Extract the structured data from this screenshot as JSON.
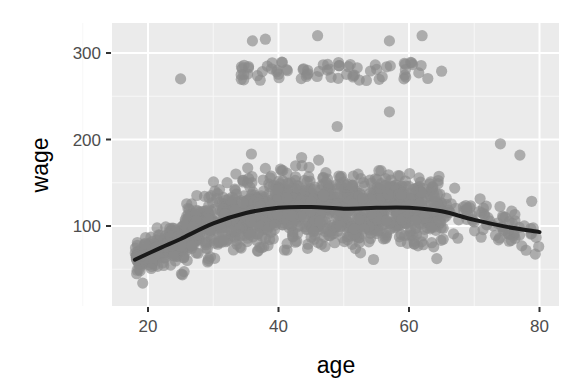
{
  "chart_data": {
    "type": "scatter",
    "title": "",
    "xlabel": "age",
    "ylabel": "wage",
    "xlim": [
      15,
      82
    ],
    "ylim": [
      8,
      335
    ],
    "x_ticks": [
      20,
      40,
      60,
      80
    ],
    "y_ticks": [
      100,
      200,
      300
    ],
    "grid": true,
    "legend": "none",
    "panel_background": "#ebebeb",
    "grid_color": "#ffffff",
    "point_color": "#8a8a8a",
    "point_alpha": 0.65,
    "line_color": "#1a1a1a",
    "series": [
      {
        "name": "points",
        "kind": "scatter",
        "description": "Approx. 3000 observations; dense band wage 40-200 across ages 18-80, peak density ages 30-60; separate high-earner band at wage ~270-285 for ages 35-62; sparse tails above 60.",
        "main_band": {
          "age_range": [
            18,
            80
          ],
          "wage_range": [
            25,
            205
          ]
        },
        "high_band": {
          "age_range": [
            34,
            63
          ],
          "wage_range": [
            268,
            290
          ]
        },
        "outliers": [
          {
            "age": 36,
            "wage": 314
          },
          {
            "age": 38,
            "wage": 316
          },
          {
            "age": 46,
            "wage": 320
          },
          {
            "age": 57,
            "wage": 314
          },
          {
            "age": 62,
            "wage": 320
          },
          {
            "age": 25,
            "wage": 270
          },
          {
            "age": 65,
            "wage": 279
          },
          {
            "age": 57,
            "wage": 232
          },
          {
            "age": 49,
            "wage": 215
          },
          {
            "age": 74,
            "wage": 195
          },
          {
            "age": 77,
            "wage": 182
          }
        ]
      },
      {
        "name": "loess smooth",
        "kind": "line",
        "x": [
          18,
          22,
          25,
          30,
          35,
          40,
          45,
          50,
          55,
          60,
          65,
          70,
          75,
          80
        ],
        "y": [
          61,
          75,
          85,
          103,
          115,
          121,
          122,
          120,
          121,
          121,
          117,
          107,
          99,
          93
        ]
      }
    ]
  }
}
